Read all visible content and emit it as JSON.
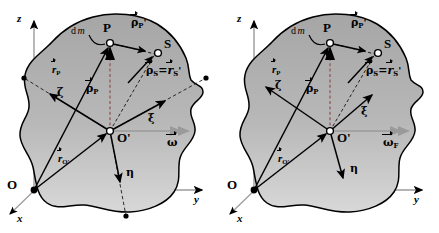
{
  "figure": {
    "type": "physics-vector-diagram",
    "panel_count": 2,
    "colors": {
      "body_fill_top": "#a9a9a9",
      "body_fill_bottom": "#d2d2d2",
      "outline": "#000000",
      "axis_grey": "#9a9a9a",
      "vector_black": "#000000",
      "background": "#ffffff"
    }
  },
  "panels": [
    {
      "id": "left",
      "name": "general-reference-point",
      "space_axes": {
        "z": "z",
        "y": "y",
        "x": "x"
      },
      "origin_label": "O",
      "body_origin_label": "O'",
      "body_axes": {
        "xi": "ξ",
        "eta": "η",
        "zeta": "ζ"
      },
      "points": [
        {
          "name": "P",
          "label": "P",
          "style": "open-circle"
        },
        {
          "name": "S",
          "label": "S",
          "style": "open-circle"
        },
        {
          "name": "O_prime",
          "label": "O'",
          "style": "open-circle"
        },
        {
          "name": "O",
          "label": "O",
          "style": "filled-dot"
        }
      ],
      "mass_element_label": "d m",
      "vectors": [
        {
          "name": "r_P",
          "symbol": "r",
          "sub": "P",
          "prime": false,
          "arrow": true
        },
        {
          "name": "rho_P",
          "symbol": "ρ",
          "sub": "P",
          "prime": false,
          "arrow": true
        },
        {
          "name": "rho_P_prime",
          "symbol": "ρ",
          "sub": "P",
          "prime": true,
          "arrow": true
        },
        {
          "name": "rho_S",
          "symbol": "ρ",
          "sub": "S",
          "prime": false,
          "arrow": true
        },
        {
          "name": "r_S_prime",
          "symbol": "r",
          "sub": "S",
          "prime": true,
          "arrow": true
        },
        {
          "name": "r_O_prime",
          "symbol": "r",
          "sub": "O'",
          "prime": false,
          "arrow": true
        },
        {
          "name": "omega",
          "symbol": "ω",
          "sub": "",
          "prime": false,
          "arrow": true
        }
      ],
      "equation_label": "ρ⃗ₛ=r⃗′ₛ",
      "angular_velocity_label": "ω",
      "has_dashed_axis_extensions": true,
      "has_boundary_dots": true
    },
    {
      "id": "right",
      "name": "center-of-mass-reference-point",
      "space_axes": {
        "z": "z",
        "y": "y",
        "x": "x"
      },
      "origin_label": "O",
      "body_origin_label": "O'",
      "body_axes": {
        "xi": "ξ",
        "eta": "η",
        "zeta": "ζ"
      },
      "points": [
        {
          "name": "P",
          "label": "P",
          "style": "open-circle"
        },
        {
          "name": "S",
          "label": "S",
          "style": "open-circle"
        },
        {
          "name": "O_prime",
          "label": "O'",
          "style": "open-circle"
        },
        {
          "name": "O",
          "label": "O",
          "style": "filled-dot"
        }
      ],
      "mass_element_label": "d m",
      "vectors": [
        {
          "name": "r_P",
          "symbol": "r",
          "sub": "P",
          "prime": false,
          "arrow": true
        },
        {
          "name": "rho_P",
          "symbol": "ρ",
          "sub": "P",
          "prime": false,
          "arrow": true
        },
        {
          "name": "rho_P_prime",
          "symbol": "ρ",
          "sub": "P",
          "prime": true,
          "arrow": true
        },
        {
          "name": "rho_S",
          "symbol": "ρ",
          "sub": "S",
          "prime": false,
          "arrow": true
        },
        {
          "name": "r_S_prime",
          "symbol": "r",
          "sub": "S",
          "prime": true,
          "arrow": true
        },
        {
          "name": "r_O_prime",
          "symbol": "r",
          "sub": "O'",
          "prime": false,
          "arrow": true
        },
        {
          "name": "omega_F",
          "symbol": "ω",
          "sub": "F",
          "prime": false,
          "arrow": true
        }
      ],
      "equation_label": "ρ⃗ₛ=r⃗′ₛ",
      "angular_velocity_label": "ω",
      "angular_velocity_sub": "F",
      "has_dashed_axis_extensions": false,
      "has_boundary_dots": false
    }
  ],
  "text": {
    "z_axis": "z",
    "y_axis": "y",
    "x_axis": "x",
    "zeta": "ζ",
    "xi": "ξ",
    "eta": "η",
    "rho": "ρ",
    "omega": "ω",
    "r": "r",
    "P": "P",
    "S": "S",
    "O": "O",
    "O_prime": "O'",
    "dm_d": "d",
    "dm_m": "m",
    "sub_P": "P",
    "sub_S": "S",
    "sub_O": "O'",
    "sub_F": "F",
    "equals": "=",
    "prime": "'"
  }
}
